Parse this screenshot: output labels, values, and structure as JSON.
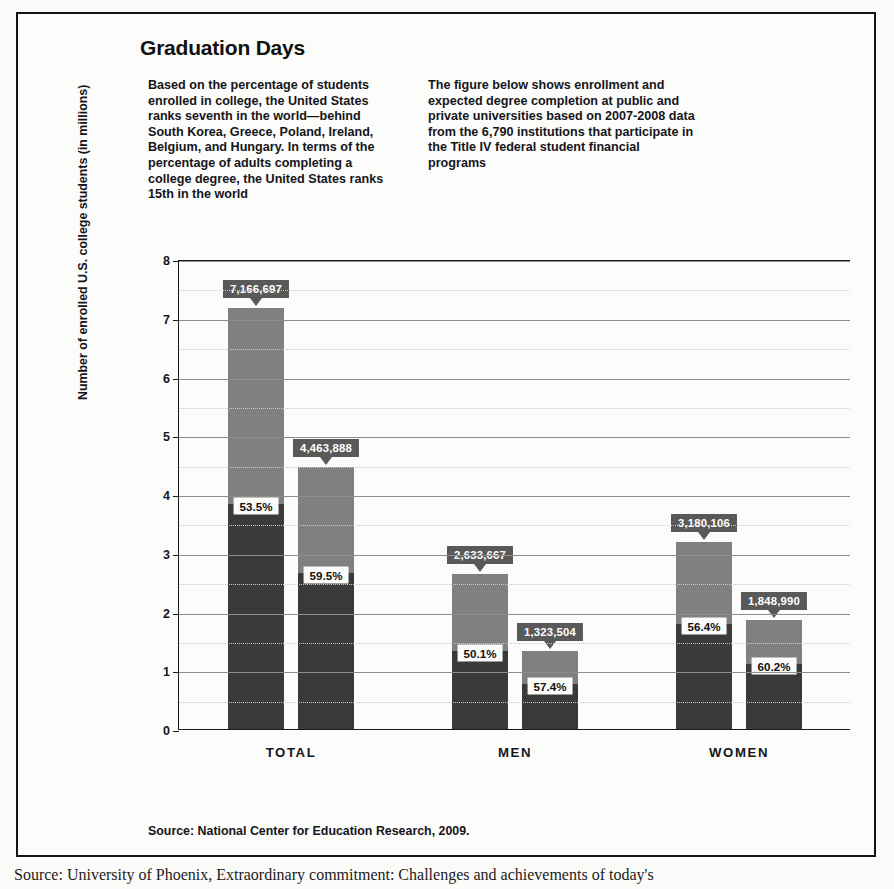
{
  "figure": {
    "title": "Graduation Days",
    "intro_left": "Based on the percentage of students enrolled in college, the United States ranks seventh in the world—behind South Korea, Greece, Poland, Ireland, Belgium, and Hungary. In terms of the percentage of adults completing a college degree, the United States ranks 15th in the world",
    "intro_right": "The figure below shows enrollment and expected degree completion at public and private universities based on 2007-2008 data from the 6,790 institutions that participate in the Title IV federal student financial programs",
    "source": "Source: National Center for Education Research, 2009."
  },
  "caption": "Source: University of Phoenix, Extraordinary commitment: Challenges and achievements of today's",
  "colors": {
    "enrolled_segment": "#808080",
    "completion_segment": "#3a3a3a",
    "callout_background": "#595959",
    "callout_text": "#ffffff",
    "gridline": "#8d8d8d",
    "axis": "#1a1a1a",
    "panel_background": "#fbfbf9"
  },
  "chart_data": {
    "type": "bar",
    "title": "Graduation Days",
    "xlabel": "",
    "ylabel": "Number of enrolled U.S. college students (in millions)",
    "ylim": [
      0,
      8
    ],
    "yticks": [
      "0",
      "1",
      "2",
      "3",
      "4",
      "5",
      "6",
      "7",
      "8"
    ],
    "minor_gridlines": true,
    "grid": true,
    "legend": "none",
    "stacked": true,
    "categories": [
      "TOTAL",
      "MEN",
      "WOMEN"
    ],
    "bars": [
      {
        "category": "TOTAL",
        "position": 0,
        "label": "7,166,697",
        "enrolled": 7166697,
        "completion_pct": "53.5%",
        "completion_value": 3834182
      },
      {
        "category": "TOTAL",
        "position": 1,
        "label": "4,463,888",
        "enrolled": 4463888,
        "completion_pct": "59.5%",
        "completion_value": 2656013
      },
      {
        "category": "MEN",
        "position": 0,
        "label": "2,633,667",
        "enrolled": 2633667,
        "completion_pct": "50.1%",
        "completion_value": 1319467
      },
      {
        "category": "MEN",
        "position": 1,
        "label": "1,323,504",
        "enrolled": 1323504,
        "completion_pct": "57.4%",
        "completion_value": 759691
      },
      {
        "category": "WOMEN",
        "position": 0,
        "label": "3,180,106",
        "enrolled": 3180106,
        "completion_pct": "56.4%",
        "completion_value": 1793580
      },
      {
        "category": "WOMEN",
        "position": 1,
        "label": "1,848,990",
        "enrolled": 1848990,
        "completion_pct": "60.2%",
        "completion_value": 1113092
      }
    ]
  }
}
